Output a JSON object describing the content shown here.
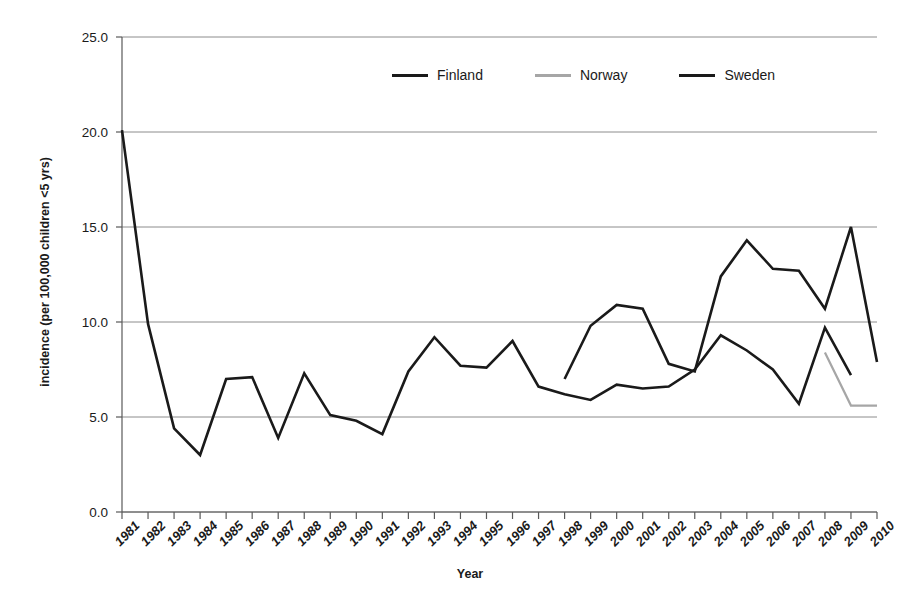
{
  "chart_data": {
    "type": "line",
    "title": "",
    "xlabel": "Year",
    "ylabel": "incidence (per 100,000 children <5 yrs)",
    "x": [
      1981,
      1982,
      1983,
      1984,
      1985,
      1986,
      1987,
      1988,
      1989,
      1990,
      1991,
      1992,
      1993,
      1994,
      1995,
      1996,
      1997,
      1998,
      1999,
      2000,
      2001,
      2002,
      2003,
      2004,
      2005,
      2006,
      2007,
      2008,
      2009,
      2010
    ],
    "xtick_labels": [
      "1981",
      "1982",
      "1983",
      "1984",
      "1985",
      "1986",
      "1987",
      "1988",
      "1989",
      "1990",
      "1991",
      "1992",
      "1993",
      "1994",
      "1995",
      "1996",
      "1997",
      "1998",
      "1999",
      "2000",
      "2001",
      "2002",
      "2003",
      "2004",
      "2005",
      "2006",
      "2007",
      "2008",
      "2009",
      "2010"
    ],
    "ytick_labels": [
      "0.0",
      "5.0",
      "10.0",
      "15.0",
      "20.0",
      "25.0"
    ],
    "ytick_values": [
      0,
      5,
      10,
      15,
      20,
      25
    ],
    "ylim": [
      0,
      25
    ],
    "grid": "horizontal",
    "legend_position": "top-center",
    "series": [
      {
        "name": "Finland",
        "color": "#1a1a1a",
        "x": [
          1981,
          1982,
          1983,
          1984,
          1985,
          1986,
          1987,
          1988,
          1989,
          1990,
          1991,
          1992,
          1993,
          1994,
          1995,
          1996,
          1997,
          1998,
          1999,
          2000,
          2001,
          2002,
          2003,
          2004,
          2005,
          2006,
          2007,
          2008,
          2009
        ],
        "values": [
          20.1,
          9.9,
          4.4,
          3.0,
          7.0,
          7.1,
          3.9,
          7.3,
          5.1,
          4.8,
          4.1,
          7.4,
          9.2,
          7.7,
          7.6,
          9.0,
          6.6,
          6.2,
          5.9,
          6.7,
          6.5,
          6.6,
          7.5,
          9.3,
          8.5,
          7.5,
          5.7,
          9.7,
          7.2
        ]
      },
      {
        "name": "Norway",
        "color": "#a6a6a6",
        "x": [
          2008,
          2009,
          2010
        ],
        "values": [
          8.4,
          5.6,
          5.6
        ]
      },
      {
        "name": "Sweden",
        "color": "#1a1a1a",
        "x": [
          1998,
          1999,
          2000,
          2001,
          2002,
          2003,
          2004,
          2005,
          2006,
          2007,
          2008,
          2009,
          2010
        ],
        "values": [
          7.0,
          9.8,
          10.9,
          10.7,
          7.8,
          7.4,
          12.4,
          14.3,
          12.8,
          12.7,
          10.7,
          15.0,
          7.9
        ]
      }
    ]
  },
  "legend": {
    "entries": [
      {
        "label": "Finland",
        "color": "#1a1a1a"
      },
      {
        "label": "Norway",
        "color": "#a6a6a6"
      },
      {
        "label": "Sweden",
        "color": "#1a1a1a"
      }
    ]
  },
  "axes": {
    "y_title": "incidence (per 100,000 children <5 yrs)",
    "x_title": "Year"
  }
}
